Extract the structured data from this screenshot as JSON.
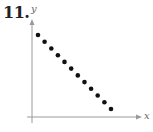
{
  "problem": {
    "number": "11."
  },
  "chart_data": {
    "type": "scatter",
    "title": "",
    "xlabel": "x",
    "ylabel": "y",
    "x": [
      1,
      2,
      3,
      4,
      5,
      6,
      7,
      8,
      9,
      10,
      11,
      12
    ],
    "y": [
      12,
      11,
      10,
      9,
      8,
      7,
      6,
      5,
      4,
      3,
      2,
      1
    ],
    "xlim": [
      0,
      13
    ],
    "ylim": [
      0,
      13.5
    ],
    "grid": false,
    "ticks": false,
    "legend": null,
    "annotations": [
      "Points show a strong negative linear correlation"
    ]
  },
  "style": {
    "axis_color": "#9a9a9a",
    "point_color": "#111111"
  }
}
